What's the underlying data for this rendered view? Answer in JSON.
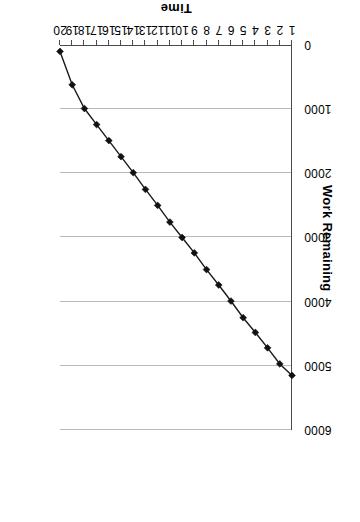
{
  "chart_data": {
    "type": "line",
    "title": "",
    "xlabel": "Time",
    "ylabel": "Work Remaining",
    "x": [
      1,
      2,
      3,
      4,
      5,
      6,
      7,
      8,
      9,
      10,
      11,
      12,
      13,
      14,
      15,
      16,
      17,
      18,
      19,
      20
    ],
    "values": [
      5150,
      4970,
      4720,
      4480,
      4250,
      3990,
      3740,
      3500,
      3240,
      3000,
      2760,
      2500,
      2250,
      1990,
      1740,
      1490,
      1240,
      990,
      620,
      100
    ],
    "series": [
      {
        "name": "Work Remaining",
        "values": [
          5150,
          4970,
          4720,
          4480,
          4250,
          3990,
          3740,
          3500,
          3240,
          3000,
          2760,
          2500,
          2250,
          1990,
          1740,
          1490,
          1240,
          990,
          620,
          100
        ]
      }
    ],
    "x_tick_labels": [
      "1",
      "2",
      "3",
      "4",
      "5",
      "6",
      "7",
      "8",
      "9",
      "10",
      "11",
      "12",
      "13",
      "14",
      "15",
      "16",
      "17",
      "18",
      "19",
      "20"
    ],
    "y_tick_labels": [
      "0",
      "1000",
      "2000",
      "3000",
      "4000",
      "5000",
      "6000"
    ],
    "y_ticks": [
      0,
      1000,
      2000,
      3000,
      4000,
      5000,
      6000
    ],
    "ylim": [
      0,
      6000
    ],
    "xlim": [
      1,
      20
    ],
    "grid": "horizontal",
    "legend": "none",
    "marker": "diamond",
    "line_color": "#1a1a1a",
    "marker_color": "#111111",
    "grid_color": "#b9b9b9",
    "axis_color": "#4a4a4a",
    "background_color": "#ffffff",
    "orientation": "rotated-180"
  }
}
